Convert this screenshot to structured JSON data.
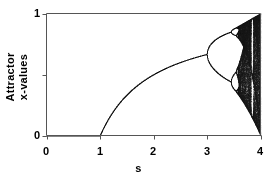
{
  "figure": {
    "background_color": "#ffffff",
    "ink_color": "#1a1a1a",
    "axis_color": "#555555"
  },
  "axes": {
    "x_title": "s",
    "y_title_line1": "Attractor",
    "y_title_line2": "x-values",
    "x_ticks": [
      "0",
      "1",
      "2",
      "3",
      "4"
    ],
    "y_ticks": [
      "0",
      "1"
    ]
  },
  "chart_data": {
    "type": "scatter",
    "title": "",
    "subtitle": "",
    "xlabel": "s",
    "ylabel": "Attractor x-values",
    "xlim": [
      0,
      4
    ],
    "ylim": [
      0,
      1
    ],
    "xticks": [
      0,
      1,
      2,
      3,
      4
    ],
    "xticklabels": [
      "0",
      "1",
      "2",
      "3",
      "4"
    ],
    "yticks": [
      0,
      0.5,
      1
    ],
    "yticklabels": [
      "0",
      "",
      "1"
    ],
    "grid": false,
    "legend": null,
    "model": {
      "name": "logistic-map",
      "equation": "x_{n+1} = s * x_n * (1 - x_n)",
      "parameter_symbol": "s",
      "parameter_min": 0,
      "parameter_max": 4,
      "parameter_steps": 1400,
      "x_initial": 0.35,
      "transient_iterations": 320,
      "plot_iterations": 260
    },
    "features": [
      {
        "label": "fixed point x = 0",
        "s_range": [
          0,
          1
        ],
        "x_value": 0
      },
      {
        "label": "fixed point x = 1 - 1/s",
        "s_range": [
          1,
          3
        ]
      },
      {
        "label": "first period-doubling (period 2)",
        "s_value": 3.0
      },
      {
        "label": "period 4",
        "s_value": 3.449
      },
      {
        "label": "period 8",
        "s_value": 3.544
      },
      {
        "label": "onset of chaos (Feigenbaum point)",
        "s_value": 3.5699
      },
      {
        "label": "period-3 window",
        "s_value": 3.8284
      },
      {
        "label": "full attractor spans 0 to 1",
        "s_value": 4.0
      }
    ],
    "series": [
      {
        "name": "attractor",
        "marker": "pixel",
        "color": "#1a1a1a",
        "size": 0.5
      }
    ]
  }
}
